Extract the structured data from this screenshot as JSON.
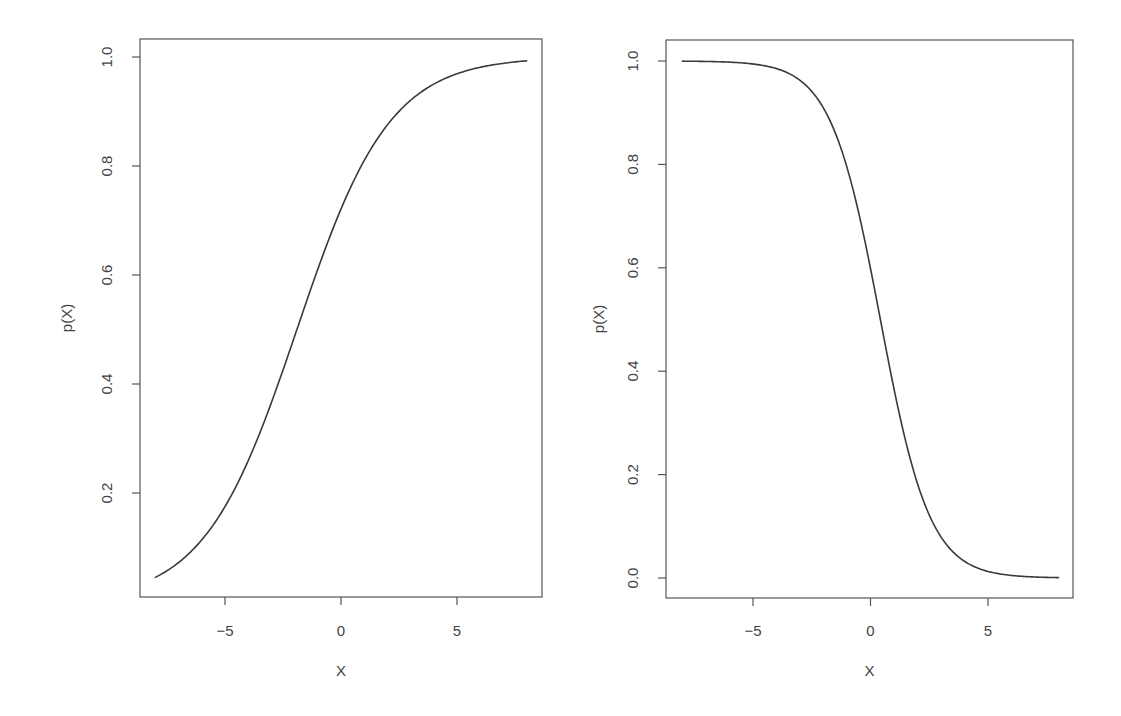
{
  "chart_data": [
    {
      "type": "line",
      "title": "",
      "xlabel": "X",
      "ylabel": "p(X)",
      "xlim": [
        -8,
        8
      ],
      "ylim": [
        0.043,
        0.993
      ],
      "xticks": [
        -5,
        0,
        5
      ],
      "xtick_labels": [
        "−5",
        "0",
        "5"
      ],
      "yticks": [
        0.2,
        0.4,
        0.6,
        0.8,
        1.0
      ],
      "ytick_labels": [
        "0.2",
        "0.4",
        "0.6",
        "0.8",
        "1.0"
      ],
      "grid": false,
      "legend": null,
      "series": [
        {
          "name": "p(X)",
          "model": "logistic",
          "intercept": 0.95,
          "slope": 0.5,
          "x": [
            -8,
            -7,
            -6,
            -5,
            -4,
            -3,
            -2,
            -1,
            0,
            1,
            2,
            3,
            4,
            5,
            6,
            7,
            8
          ],
          "y": [
            0.045,
            0.073,
            0.114,
            0.175,
            0.259,
            0.365,
            0.485,
            0.61,
            0.721,
            0.81,
            0.875,
            0.92,
            0.95,
            0.969,
            0.981,
            0.988,
            0.993
          ]
        }
      ]
    },
    {
      "type": "line",
      "title": "",
      "xlabel": "X",
      "ylabel": "p(X)",
      "xlim": [
        -8,
        8
      ],
      "ylim": [
        0.0,
        1.0
      ],
      "xticks": [
        -5,
        0,
        5
      ],
      "xtick_labels": [
        "−5",
        "0",
        "5"
      ],
      "yticks": [
        0.0,
        0.2,
        0.4,
        0.6,
        0.8,
        1.0
      ],
      "ytick_labels": [
        "0.0",
        "0.2",
        "0.4",
        "0.6",
        "0.8",
        "1.0"
      ],
      "grid": false,
      "legend": null,
      "series": [
        {
          "name": "p(X)",
          "model": "logistic",
          "intercept": 0.4,
          "slope": -0.95,
          "x": [
            -8,
            -7,
            -6,
            -5,
            -4,
            -3,
            -2,
            -1,
            0,
            1,
            2,
            3,
            4,
            5,
            6,
            7,
            8
          ],
          "y": [
            0.9997,
            0.9992,
            0.9979,
            0.9945,
            0.9852,
            0.9608,
            0.9089,
            0.7941,
            0.5987,
            0.3635,
            0.1824,
            0.0794,
            0.0323,
            0.0127,
            0.0049,
            0.0019,
            0.0007
          ]
        }
      ]
    }
  ],
  "layout": {
    "panels": [
      {
        "frame": {
          "left": 140,
          "top": 39,
          "right": 542,
          "bottom": 597
        },
        "x_px": {
          "v0": -5,
          "p0": 225,
          "v1": 5,
          "p1": 457
        },
        "y_px": {
          "v0": 0.2,
          "p0": 493,
          "v1": 1.0,
          "p1": 57
        },
        "ylabel_x": 72,
        "ytick_label_x": 112,
        "xtick_label_y": 636,
        "xlabel_y": 676
      },
      {
        "frame": {
          "left": 666,
          "top": 40,
          "right": 1073,
          "bottom": 598
        },
        "x_px": {
          "v0": -5,
          "p0": 753,
          "v1": 5,
          "p1": 988
        },
        "y_px": {
          "v0": 0.0,
          "p0": 578,
          "v1": 1.0,
          "p1": 61
        },
        "ylabel_x": 604,
        "ytick_label_x": 638,
        "xtick_label_y": 636,
        "xlabel_y": 676
      }
    ]
  }
}
